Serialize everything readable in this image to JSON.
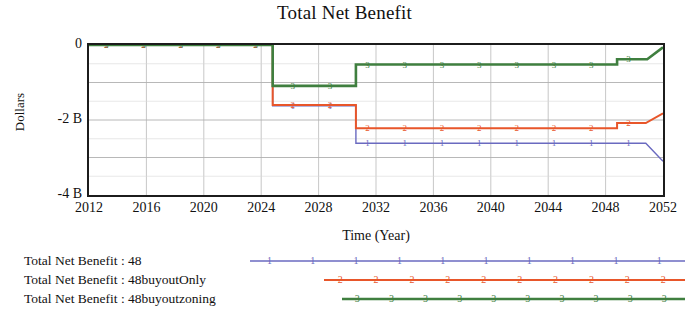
{
  "chart_data": {
    "type": "line",
    "title": "Total Net Benefit",
    "xlabel": "Time (Year)",
    "ylabel": "Dollars",
    "xlim": [
      2012,
      2052
    ],
    "ylim": [
      -4000000000,
      0
    ],
    "xticks": [
      2012,
      2016,
      2020,
      2024,
      2028,
      2032,
      2036,
      2040,
      2044,
      2048,
      2052
    ],
    "xtick_labels": [
      "2012",
      "2016",
      "2020",
      "2024",
      "2028",
      "2032",
      "2036",
      "2040",
      "2044",
      "2048",
      "2052"
    ],
    "yticks": [
      0,
      -2000000000,
      -4000000000
    ],
    "ytick_labels": [
      "0",
      "-2 B",
      "-4 B"
    ],
    "grid": true,
    "legend_position": "below",
    "series": [
      {
        "name": "Total Net Benefit : 48",
        "marker": "1",
        "color": "#6a6ac0",
        "x": [
          2012,
          2024.8,
          2024.8,
          2030.6,
          2030.6,
          2050.8,
          2050.8,
          2052
        ],
        "y": [
          0,
          0,
          -1.62,
          -1.62,
          -2.62,
          -2.62,
          -2.62,
          -3.1
        ],
        "units": "billions of dollars"
      },
      {
        "name": "Total Net Benefit : 48buyoutOnly",
        "marker": "2",
        "color": "#e8562a",
        "x": [
          2012,
          2024.8,
          2024.8,
          2030.6,
          2030.6,
          2048.8,
          2048.8,
          2050.8,
          2050.8,
          2052
        ],
        "y": [
          0,
          0,
          -1.6,
          -1.6,
          -2.22,
          -2.22,
          -2.08,
          -2.08,
          -2.08,
          -1.82
        ],
        "units": "billions of dollars"
      },
      {
        "name": "Total Net Benefit : 48buyoutzoning",
        "marker": "3",
        "color": "#3f7f3f",
        "x": [
          2012,
          2024.8,
          2024.8,
          2030.6,
          2030.6,
          2048.8,
          2048.8,
          2050.9,
          2050.9,
          2052
        ],
        "y": [
          0,
          0,
          -1.09,
          -1.09,
          -0.52,
          -0.52,
          -0.38,
          -0.38,
          -0.38,
          -0.06
        ],
        "units": "billions of dollars"
      }
    ]
  },
  "legend": {
    "entries": [
      {
        "label": "Total Net Benefit : 48",
        "marker": "1",
        "color": "#6a6ac0"
      },
      {
        "label": "Total Net Benefit : 48buyoutOnly",
        "marker": "2",
        "color": "#e8562a"
      },
      {
        "label": "Total Net Benefit : 48buyoutzoning",
        "marker": "3",
        "color": "#3f7f3f"
      }
    ]
  }
}
